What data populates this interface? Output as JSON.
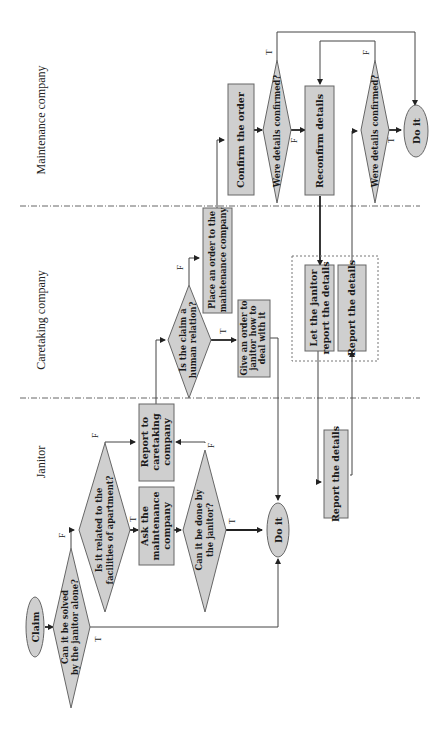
{
  "diagram": {
    "type": "swimlane-flowchart",
    "orientation": "rotated-90-ccw",
    "lanes": [
      {
        "id": "janitor",
        "label": "Janitor"
      },
      {
        "id": "caretaking",
        "label": "Caretaking company"
      },
      {
        "id": "maintenance",
        "label": "Maintenance company"
      }
    ],
    "nodes": {
      "claim": {
        "shape": "terminator",
        "lines": [
          "Claim"
        ]
      },
      "d_solved_alone": {
        "shape": "decision",
        "lines": [
          "Can it be solved",
          "by the janitor alone?"
        ]
      },
      "d_facilities": {
        "shape": "decision",
        "lines": [
          "Is it related to the",
          "facilities of apartment?"
        ]
      },
      "report_caretaking": {
        "shape": "process",
        "lines": [
          "Report to",
          "caretaking",
          "company"
        ]
      },
      "ask_maintenance": {
        "shape": "process",
        "lines": [
          "Ask the",
          "maintenance",
          "company"
        ]
      },
      "d_done_by_janitor": {
        "shape": "decision",
        "lines": [
          "Can it be done by",
          "the janitor?"
        ]
      },
      "do_it_janitor": {
        "shape": "terminator",
        "lines": [
          "Do it"
        ]
      },
      "report_details_janitor": {
        "shape": "process",
        "lines": [
          "Report the details"
        ]
      },
      "d_human_relation": {
        "shape": "decision",
        "lines": [
          "Is the claim a",
          "human relation?"
        ]
      },
      "place_order": {
        "shape": "process",
        "lines": [
          "Place an order to the",
          "maintenance company"
        ]
      },
      "give_order": {
        "shape": "process",
        "lines": [
          "Give an order to",
          "janitor how to",
          "deal with it"
        ]
      },
      "let_janitor_report": {
        "shape": "process",
        "lines": [
          "Let the janitor",
          "report the details"
        ]
      },
      "report_details_caretaking": {
        "shape": "process",
        "lines": [
          "Report the details"
        ]
      },
      "confirm_order": {
        "shape": "process",
        "lines": [
          "Confirm the order"
        ]
      },
      "d_confirmed_1": {
        "shape": "decision",
        "lines": [
          "Were details confirmed?"
        ]
      },
      "reconfirm": {
        "shape": "process",
        "lines": [
          "Reconfirm details"
        ]
      },
      "d_confirmed_2": {
        "shape": "decision",
        "lines": [
          "Were details confirmed?"
        ]
      },
      "do_it_maintenance": {
        "shape": "terminator",
        "lines": [
          "Do it"
        ]
      }
    },
    "edge_labels": {
      "true": "T",
      "false": "F"
    },
    "edges": [
      {
        "from": "claim",
        "to": "d_solved_alone"
      },
      {
        "from": "d_solved_alone",
        "to": "d_facilities",
        "label": "F"
      },
      {
        "from": "d_solved_alone",
        "to": "do_it_janitor",
        "label": "T"
      },
      {
        "from": "d_facilities",
        "to": "report_caretaking",
        "label": "F"
      },
      {
        "from": "d_facilities",
        "to": "ask_maintenance",
        "label": "T"
      },
      {
        "from": "ask_maintenance",
        "to": "d_done_by_janitor"
      },
      {
        "from": "d_done_by_janitor",
        "to": "report_caretaking",
        "label": "F"
      },
      {
        "from": "d_done_by_janitor",
        "to": "do_it_janitor",
        "label": "T"
      },
      {
        "from": "report_caretaking",
        "to": "d_human_relation"
      },
      {
        "from": "d_human_relation",
        "to": "place_order",
        "label": "F"
      },
      {
        "from": "d_human_relation",
        "to": "give_order",
        "label": "T"
      },
      {
        "from": "give_order",
        "to": "do_it_janitor"
      },
      {
        "from": "place_order",
        "to": "confirm_order"
      },
      {
        "from": "confirm_order",
        "to": "d_confirmed_1"
      },
      {
        "from": "d_confirmed_1",
        "to": "do_it_maintenance",
        "label": "T"
      },
      {
        "from": "d_confirmed_1",
        "to": "reconfirm",
        "label": "F"
      },
      {
        "from": "reconfirm",
        "to": "let_janitor_report"
      },
      {
        "from": "let_janitor_report",
        "to": "report_details_janitor"
      },
      {
        "from": "report_details_janitor",
        "to": "report_details_caretaking"
      },
      {
        "from": "report_details_caretaking",
        "to": "d_confirmed_2"
      },
      {
        "from": "d_confirmed_2",
        "to": "reconfirm",
        "label": "F"
      },
      {
        "from": "d_confirmed_2",
        "to": "do_it_maintenance",
        "label": "T"
      }
    ]
  }
}
